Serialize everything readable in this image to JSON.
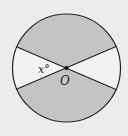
{
  "diagram": {
    "type": "circle-with-intersecting-diameters",
    "center_label": "O",
    "angle_label": "x°",
    "colors": {
      "background": "#ececec",
      "shaded": "#c4c4c4",
      "unshaded": "#f2f2f2",
      "stroke": "#222222"
    },
    "regions": [
      {
        "name": "top-sector",
        "shaded": true
      },
      {
        "name": "bottom-sector",
        "shaded": true
      },
      {
        "name": "left-sector",
        "shaded": false,
        "angle": "x°"
      },
      {
        "name": "right-sector",
        "shaded": false
      }
    ]
  }
}
